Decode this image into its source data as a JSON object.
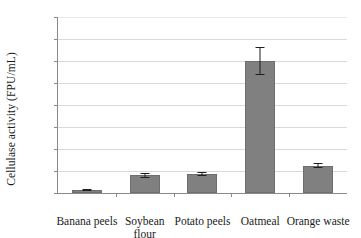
{
  "chart_data": {
    "type": "bar",
    "title": "",
    "xlabel": "",
    "ylabel": "Cellulase activity (FPU/mL)",
    "categories": [
      "Banana peels",
      "Soybean\nflour",
      "Potato peels",
      "Oatmeal",
      "Orange waste"
    ],
    "values": [
      0.25,
      1.6,
      1.7,
      12.0,
      2.5
    ],
    "errors": [
      0.1,
      0.25,
      0.2,
      1.3,
      0.25
    ],
    "ylim": [
      0,
      16
    ],
    "yticks": [
      0,
      2,
      4,
      6,
      8,
      10,
      12,
      14,
      16
    ],
    "ytick_labels": [
      "0",
      "2",
      "4",
      "6",
      "8",
      "10",
      "12",
      "14",
      "16"
    ],
    "grid": "horizontal",
    "legend": "none",
    "bar_color": "#808080",
    "error_color": "#1f1f1f",
    "grid_color": "#d9d9d9",
    "axis_color": "#8a8a8a"
  }
}
